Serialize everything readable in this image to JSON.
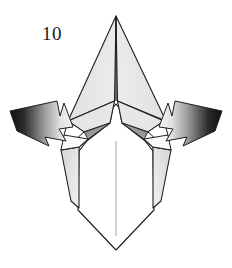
{
  "figure": {
    "kind": "origami-fold-diagram",
    "step_number": "10",
    "background_color": "#ffffff",
    "line_color": "#1f1f1f",
    "paper_front_color": "#ffffff",
    "paper_back_color": "#e6e6e6",
    "shadow_color": "#bfbfbf"
  },
  "labels": {
    "step_number": "10"
  },
  "arrows": [
    {
      "name": "left-push-arrow",
      "direction": "right-down",
      "gradient_from": "#151515",
      "gradient_to": "#f2f2f2",
      "outline_color": "#1f1f1f"
    },
    {
      "name": "right-push-arrow",
      "direction": "left-down",
      "gradient_from": "#151515",
      "gradient_to": "#f2f2f2",
      "outline_color": "#1f1f1f"
    }
  ],
  "shapes": [
    {
      "name": "upper-left-flap",
      "fill": "#e3e3e3"
    },
    {
      "name": "upper-right-flap",
      "fill": "#e3e3e3"
    },
    {
      "name": "left-side-panel",
      "fill": "#e0e0e0"
    },
    {
      "name": "right-side-panel",
      "fill": "#e0e0e0"
    },
    {
      "name": "lower-body-front",
      "fill": "#ffffff"
    },
    {
      "name": "left-inner-wedge",
      "fill": "#9a9a9a"
    },
    {
      "name": "right-inner-wedge",
      "fill": "#9a9a9a"
    },
    {
      "name": "center-crease-line",
      "fill": "none"
    }
  ]
}
